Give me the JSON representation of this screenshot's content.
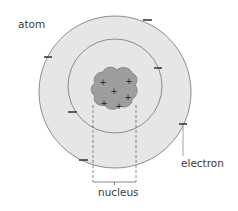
{
  "diagram": {
    "labels": {
      "atom": "atom",
      "electron": "electron",
      "nucleus": "nucleus"
    },
    "nucleus": {
      "charges": [
        "+",
        "+",
        "+",
        "+",
        "+",
        "+"
      ],
      "proton_count": 6
    },
    "electrons": {
      "symbol": "−",
      "count": 6,
      "inner_shell_count": 2,
      "outer_shell_count": 4
    },
    "colors": {
      "atom_fill": "#e6e6e6",
      "orbit_stroke": "#8c8c8c",
      "nucleus_fill": "#9e9e9e",
      "nucleus_stroke": "#7a7a7a",
      "text": "#3a3a3a"
    }
  }
}
